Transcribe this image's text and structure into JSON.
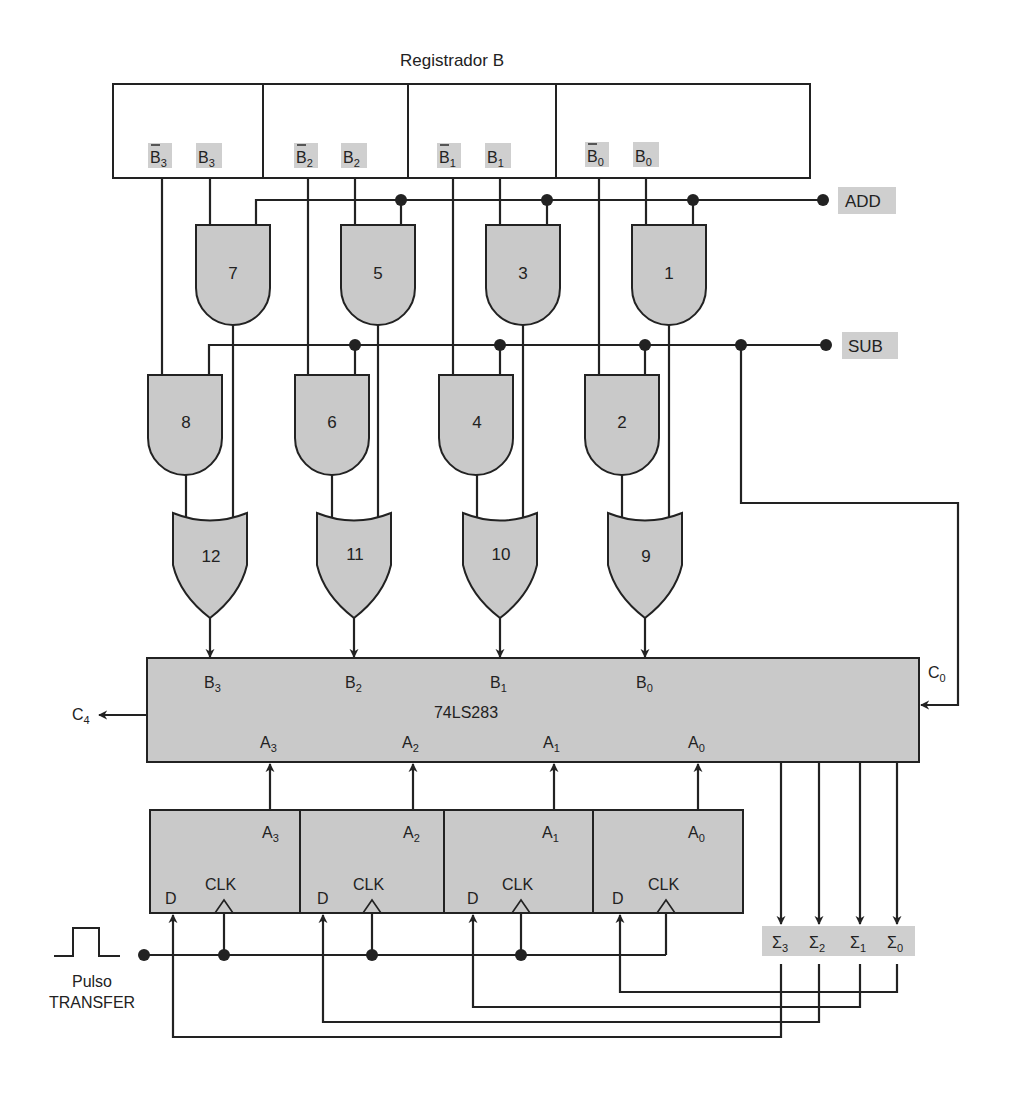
{
  "title": "Registrador B",
  "register_b": {
    "bits": [
      {
        "bar_label": "B",
        "bar_sub": "3",
        "label": "B",
        "sub": "3"
      },
      {
        "bar_label": "B",
        "bar_sub": "2",
        "label": "B",
        "sub": "2"
      },
      {
        "bar_label": "B",
        "bar_sub": "1",
        "label": "B",
        "sub": "1"
      },
      {
        "bar_label": "B",
        "bar_sub": "0",
        "label": "B",
        "sub": "0"
      }
    ]
  },
  "controls": {
    "add": "ADD",
    "sub": "SUB"
  },
  "gates": {
    "and_top": [
      "7",
      "5",
      "3",
      "1"
    ],
    "and_mid": [
      "8",
      "6",
      "4",
      "2"
    ],
    "or": [
      "12",
      "11",
      "10",
      "9"
    ]
  },
  "adder": {
    "name": "74LS283",
    "b_inputs": [
      {
        "l": "B",
        "s": "3"
      },
      {
        "l": "B",
        "s": "2"
      },
      {
        "l": "B",
        "s": "1"
      },
      {
        "l": "B",
        "s": "0"
      }
    ],
    "a_inputs": [
      {
        "l": "A",
        "s": "3"
      },
      {
        "l": "A",
        "s": "2"
      },
      {
        "l": "A",
        "s": "1"
      },
      {
        "l": "A",
        "s": "0"
      }
    ],
    "carry_in": {
      "l": "C",
      "s": "0"
    },
    "carry_out": {
      "l": "C",
      "s": "4"
    }
  },
  "accumulator": {
    "flipflops": [
      {
        "q": "A",
        "s": "3",
        "d": "D",
        "clk": "CLK"
      },
      {
        "q": "A",
        "s": "2",
        "d": "D",
        "clk": "CLK"
      },
      {
        "q": "A",
        "s": "1",
        "d": "D",
        "clk": "CLK"
      },
      {
        "q": "A",
        "s": "0",
        "d": "D",
        "clk": "CLK"
      }
    ]
  },
  "sums": [
    {
      "l": "Σ",
      "s": "3"
    },
    {
      "l": "Σ",
      "s": "2"
    },
    {
      "l": "Σ",
      "s": "1"
    },
    {
      "l": "Σ",
      "s": "0"
    }
  ],
  "transfer": {
    "line1": "Pulso",
    "line2": "TRANSFER"
  }
}
